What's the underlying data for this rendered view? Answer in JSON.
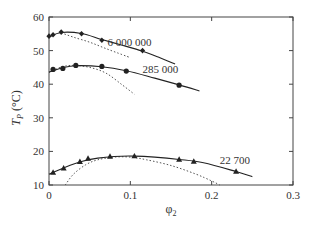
{
  "chart_data": {
    "type": "line",
    "title": "",
    "xlabel": "φ2",
    "ylabel": "Tp (°C)",
    "xlim": [
      0,
      0.3
    ],
    "ylim": [
      10,
      60
    ],
    "xticks": [
      "0",
      "0.1",
      "0.2",
      "0.3"
    ],
    "yticks": [
      "10",
      "20",
      "30",
      "40",
      "50",
      "60"
    ],
    "grid": false,
    "legend": "inline labels",
    "series": [
      {
        "name": "6 000 000",
        "marker": "diamond",
        "points": [
          [
            0.0,
            54.3
          ],
          [
            0.005,
            54.7
          ],
          [
            0.015,
            55.5
          ],
          [
            0.04,
            55.0
          ],
          [
            0.065,
            53.1
          ],
          [
            0.115,
            50.0
          ]
        ],
        "fit": [
          [
            0.0,
            54.0
          ],
          [
            0.015,
            55.4
          ],
          [
            0.04,
            55.1
          ],
          [
            0.065,
            53.3
          ],
          [
            0.09,
            51.6
          ],
          [
            0.115,
            49.8
          ],
          [
            0.135,
            48.0
          ],
          [
            0.155,
            46.0
          ]
        ],
        "theory_dotted": [
          [
            0.015,
            55.3
          ],
          [
            0.03,
            54.0
          ],
          [
            0.05,
            52.5
          ],
          [
            0.07,
            50.6
          ],
          [
            0.09,
            48.8
          ],
          [
            0.1,
            47.9
          ]
        ]
      },
      {
        "name": "285 000",
        "marker": "circle",
        "points": [
          [
            0.005,
            44.4
          ],
          [
            0.017,
            44.7
          ],
          [
            0.033,
            45.6
          ],
          [
            0.065,
            45.3
          ],
          [
            0.095,
            43.9
          ],
          [
            0.16,
            39.7
          ]
        ],
        "fit": [
          [
            0.0,
            43.6
          ],
          [
            0.017,
            44.9
          ],
          [
            0.033,
            45.5
          ],
          [
            0.065,
            45.2
          ],
          [
            0.095,
            44.0
          ],
          [
            0.13,
            41.8
          ],
          [
            0.16,
            39.8
          ],
          [
            0.185,
            38.0
          ]
        ],
        "theory_dotted": [
          [
            0.0,
            43.5
          ],
          [
            0.015,
            45.1
          ],
          [
            0.03,
            45.6
          ],
          [
            0.05,
            45.0
          ],
          [
            0.07,
            43.3
          ],
          [
            0.09,
            39.8
          ],
          [
            0.105,
            37.0
          ]
        ]
      },
      {
        "name": "22 700",
        "marker": "triangle",
        "points": [
          [
            0.005,
            13.7
          ],
          [
            0.018,
            15.0
          ],
          [
            0.038,
            16.9
          ],
          [
            0.048,
            17.9
          ],
          [
            0.075,
            18.5
          ],
          [
            0.105,
            18.6
          ],
          [
            0.16,
            17.6
          ],
          [
            0.178,
            17.0
          ],
          [
            0.23,
            14.0
          ]
        ],
        "fit": [
          [
            0.0,
            13.2
          ],
          [
            0.02,
            15.3
          ],
          [
            0.04,
            17.0
          ],
          [
            0.06,
            18.0
          ],
          [
            0.08,
            18.5
          ],
          [
            0.105,
            18.6
          ],
          [
            0.13,
            18.3
          ],
          [
            0.16,
            17.6
          ],
          [
            0.19,
            16.6
          ],
          [
            0.23,
            14.0
          ],
          [
            0.25,
            12.5
          ]
        ],
        "theory_dotted": [
          [
            0.02,
            10.0
          ],
          [
            0.03,
            13.2
          ],
          [
            0.045,
            16.0
          ],
          [
            0.06,
            17.5
          ],
          [
            0.08,
            18.3
          ],
          [
            0.1,
            18.3
          ],
          [
            0.12,
            17.5
          ],
          [
            0.15,
            15.8
          ],
          [
            0.18,
            13.3
          ],
          [
            0.2,
            11.2
          ],
          [
            0.21,
            10.0
          ]
        ]
      }
    ],
    "annotations": [
      {
        "text": "6 000 000",
        "x": 0.072,
        "y": 51.3
      },
      {
        "text": "285 000",
        "x": 0.115,
        "y": 43.3
      },
      {
        "text": "22 700",
        "x": 0.21,
        "y": 16.2
      }
    ]
  },
  "labels": {
    "ylabel_main": "T",
    "ylabel_sub": "P",
    "ylabel_unit": " (°C)",
    "xlabel_main": "φ",
    "xlabel_sub": "2"
  }
}
